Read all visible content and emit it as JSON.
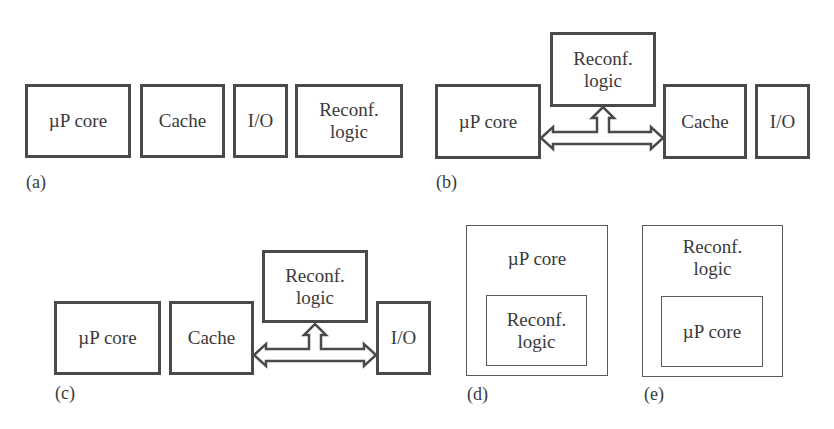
{
  "diagrams": {
    "a": {
      "label": "(a)",
      "blocks": [
        "µP core",
        "Cache",
        "I/O",
        "Reconf.\nlogic"
      ]
    },
    "b": {
      "label": "(b)",
      "blocks": [
        "µP core",
        "Reconf.\nlogic",
        "Cache",
        "I/O"
      ],
      "connection": "bus between µP core and Cache with branch to Reconf. logic"
    },
    "c": {
      "label": "(c)",
      "blocks": [
        "µP core",
        "Cache",
        "Reconf.\nlogic",
        "I/O"
      ],
      "connection": "bus between Cache and I/O with branch to Reconf. logic"
    },
    "d": {
      "label": "(d)",
      "outer": "µP core",
      "inner": "Reconf.\nlogic"
    },
    "e": {
      "label": "(e)",
      "outer": "Reconf.\nlogic",
      "inner": "µP core"
    }
  },
  "colors": {
    "stroke": "#4a4a4a",
    "text": "#3a3a3a",
    "background": "#ffffff"
  }
}
